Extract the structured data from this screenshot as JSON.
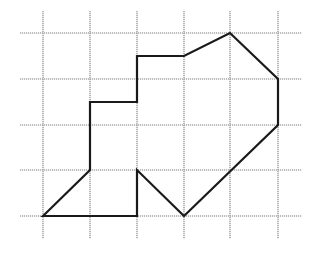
{
  "diagram": {
    "type": "grid-polygon",
    "width": 318,
    "height": 262,
    "grid": {
      "color": "#a9a9a9",
      "columns_x": [
        43,
        90,
        137,
        184,
        230,
        278
      ],
      "rows_y": [
        33,
        79,
        125,
        170,
        216
      ],
      "h_extent": [
        20,
        302
      ],
      "v_extent": [
        11,
        239
      ]
    },
    "polygon": {
      "stroke_color": "#1a1a1a",
      "grid_units_note": "grid cell = 1 unit; origin at bottom-left grid node",
      "vertices_grid": [
        [
          0,
          0
        ],
        [
          1,
          1
        ],
        [
          1,
          2.5
        ],
        [
          2,
          2.5
        ],
        [
          2,
          3.5
        ],
        [
          3,
          3.5
        ],
        [
          4,
          4
        ],
        [
          5,
          3
        ],
        [
          5,
          2
        ],
        [
          3,
          0
        ],
        [
          2,
          1
        ],
        [
          2,
          0
        ]
      ],
      "vertices_px": [
        [
          43,
          216
        ],
        [
          90,
          170
        ],
        [
          90,
          102
        ],
        [
          137,
          102
        ],
        [
          137,
          56
        ],
        [
          184,
          56
        ],
        [
          230,
          33
        ],
        [
          278,
          79
        ],
        [
          278,
          125
        ],
        [
          184,
          216
        ],
        [
          137,
          170
        ],
        [
          137,
          216
        ]
      ]
    }
  }
}
